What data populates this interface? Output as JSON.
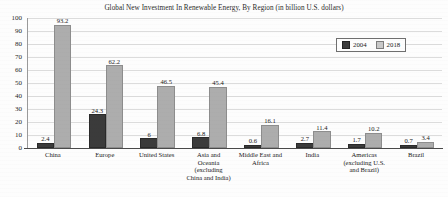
{
  "chart_data": {
    "type": "bar",
    "title": "Global New Investment In Renewable Energy, By Region (in billion U.S. dollars)",
    "xlabel": "",
    "ylabel": "",
    "ylim": [
      0,
      100
    ],
    "yticks": [
      100,
      90,
      80,
      70,
      60,
      50,
      40,
      30,
      20,
      10,
      0
    ],
    "grid": true,
    "legend_position": "top-right",
    "categories": [
      "China",
      "Europe",
      "United States",
      "Asia and Oceania (excluding China and India)",
      "Middle East and Africa",
      "India",
      "Americas (excluding U.S. and Brazil)",
      "Brazil"
    ],
    "category_lines": [
      [
        "China"
      ],
      [
        "Europe"
      ],
      [
        "United States"
      ],
      [
        "Asia and",
        "Oceania",
        "(excluding",
        "China and India)"
      ],
      [
        "Middle East and",
        "Africa"
      ],
      [
        "India"
      ],
      [
        "Americas",
        "(excluding U.S.",
        "and Brazil)"
      ],
      [
        "Brazil"
      ]
    ],
    "series": [
      {
        "name": "2004",
        "color": "#3b3b3b",
        "values": [
          2.4,
          24.3,
          6,
          6.8,
          0.6,
          2.7,
          1.7,
          0.7
        ],
        "labels": [
          "2.4",
          "24.3",
          "6",
          "6.8",
          "0.6",
          "2.7",
          "1.7",
          "0.7"
        ]
      },
      {
        "name": "2018",
        "color": "#adadad",
        "values": [
          93.2,
          62.2,
          46.5,
          45.4,
          16.1,
          11.4,
          10.2,
          3.4
        ],
        "labels": [
          "93.2",
          "62.2",
          "46.5",
          "45.4",
          "16.1",
          "11.4",
          "10.2",
          "3.4"
        ]
      }
    ]
  },
  "legend": {
    "items": [
      {
        "label": "2004"
      },
      {
        "label": "2018"
      }
    ]
  }
}
